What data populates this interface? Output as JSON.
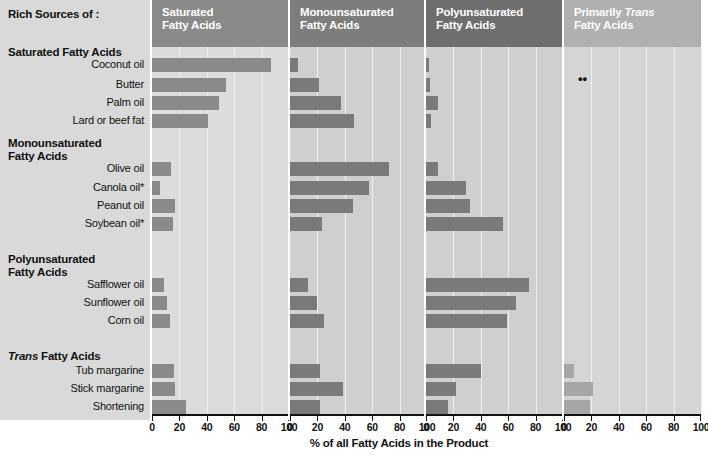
{
  "header": {
    "title": "Rich Sources of :"
  },
  "groups": [
    {
      "id": "sat",
      "label": "Saturated Fatty Acids",
      "italic_word": ""
    },
    {
      "id": "mono",
      "label": "Monounsaturated\nFatty Acids",
      "italic_word": ""
    },
    {
      "id": "poly",
      "label": "Polyunsaturated\nFatty Acids",
      "italic_word": ""
    },
    {
      "id": "trans",
      "label": "Trans Fatty Acids",
      "italic_word": "Trans"
    }
  ],
  "row_labels": [
    "Coconut oil",
    "Butter",
    "Palm oil",
    "Lard or beef fat",
    "Olive oil",
    "Canola oil*",
    "Peanut oil",
    "Soybean oil*",
    "Safflower oil",
    "Sunflower oil",
    "Corn oil",
    "Tub margarine",
    "Stick margarine",
    "Shortening"
  ],
  "panels": [
    {
      "id": "saturated",
      "title_line1": "Saturated",
      "title_line2": "Fatty Acids",
      "italic": "",
      "header_shade": "#8a8a8a",
      "plot_shade": "#dcdcdc"
    },
    {
      "id": "monounsaturated",
      "title_line1": "Monounsaturated",
      "title_line2": "Fatty Acids",
      "italic": "",
      "header_shade": "#7d7d7d",
      "plot_shade": "#cfcfcf"
    },
    {
      "id": "polyunsaturated",
      "title_line1": "Polyunsaturated",
      "title_line2": "Fatty Acids",
      "italic": "",
      "header_shade": "#6e6e6e",
      "plot_shade": "#cfcfcf"
    },
    {
      "id": "primarily-trans",
      "title_line1": "Primarily Trans",
      "title_line2": "Fatty Acids",
      "italic": "Trans",
      "header_shade": "#b0b0b0",
      "plot_shade": "#d5d5d5"
    }
  ],
  "axis": {
    "ticks": [
      0,
      20,
      40,
      60,
      80,
      100
    ],
    "min": 0,
    "max": 100,
    "title": "% of all Fatty Acids in the Product"
  },
  "annotations": {
    "double_dagger": "••"
  },
  "colors": {
    "label_panel_bg": "#d9d9d9",
    "bar": "#8a8a8a",
    "bar_light": "#a6a6a6",
    "gridline": "#efefef",
    "axis": "#111111"
  },
  "chart_data": {
    "type": "bar",
    "title": "Rich Sources of :",
    "xlabel": "% of all Fatty Acids in the Product",
    "ylabel": "",
    "xlim": [
      0,
      100
    ],
    "grid": true,
    "legend": "none",
    "orientation": "horizontal",
    "panels": [
      "Saturated Fatty Acids",
      "Monounsaturated Fatty Acids",
      "Polyunsaturated Fatty Acids",
      "Primarily Trans Fatty Acids"
    ],
    "categories": [
      "Coconut oil",
      "Butter",
      "Palm oil",
      "Lard or beef fat",
      "Olive oil",
      "Canola oil*",
      "Peanut oil",
      "Soybean oil*",
      "Safflower oil",
      "Sunflower oil",
      "Corn oil",
      "Tub margarine",
      "Stick margarine",
      "Shortening"
    ],
    "series": [
      {
        "name": "Saturated Fatty Acids",
        "values": [
          87,
          54,
          49,
          41,
          14,
          6,
          17,
          15,
          9,
          11,
          13,
          16,
          17,
          25
        ]
      },
      {
        "name": "Monounsaturated Fatty Acids",
        "values": [
          6,
          21,
          37,
          47,
          72,
          58,
          46,
          23,
          13,
          20,
          25,
          22,
          39,
          22
        ]
      },
      {
        "name": "Polyunsaturated Fatty Acids",
        "values": [
          2,
          3,
          9,
          4,
          9,
          29,
          32,
          56,
          75,
          66,
          59,
          40,
          22,
          16
        ]
      },
      {
        "name": "Primarily Trans Fatty Acids",
        "values": [
          0,
          0,
          0,
          0,
          0,
          0,
          0,
          0,
          0,
          0,
          0,
          7,
          21,
          19
        ]
      }
    ],
    "row_groups": [
      {
        "name": "Saturated Fatty Acids",
        "rows": [
          0,
          1,
          2,
          3
        ]
      },
      {
        "name": "Monounsaturated Fatty Acids",
        "rows": [
          4,
          5,
          6,
          7
        ]
      },
      {
        "name": "Polyunsaturated Fatty Acids",
        "rows": [
          8,
          9,
          10
        ]
      },
      {
        "name": "Trans Fatty Acids",
        "rows": [
          11,
          12,
          13
        ]
      }
    ],
    "annotations": [
      {
        "text": "••",
        "panel": "Primarily Trans Fatty Acids",
        "row": "Butter"
      }
    ]
  }
}
